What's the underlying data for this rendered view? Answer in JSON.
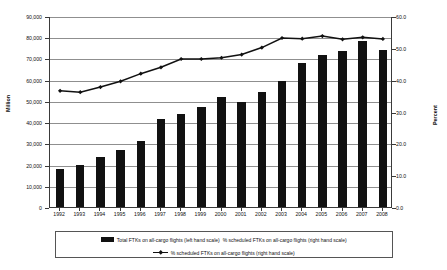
{
  "chart_data": {
    "type": "bar",
    "title": "",
    "xlabel": "",
    "ylabel": "Million",
    "y2label": "Percent",
    "ylim": [
      0,
      90000
    ],
    "y2lim": [
      0,
      60
    ],
    "yticks": [
      "0",
      "10,000",
      "20,000",
      "30,000",
      "40,000",
      "50,000",
      "60,000",
      "70,000",
      "80,000",
      "90,000"
    ],
    "ytick_values": [
      0,
      10000,
      20000,
      30000,
      40000,
      50000,
      60000,
      70000,
      80000,
      90000
    ],
    "y2ticks": [
      "0.0",
      "10.0",
      "20.0",
      "30.0",
      "40.0",
      "50.0",
      "60.0"
    ],
    "y2tick_values": [
      0,
      10,
      20,
      30,
      40,
      50,
      60
    ],
    "grid": true,
    "legend_position": "bottom",
    "categories": [
      "1992",
      "1993",
      "1994",
      "1995",
      "1996",
      "1997",
      "1998",
      "1999",
      "2000",
      "2001",
      "2002",
      "2003",
      "2004",
      "2005",
      "2006",
      "2007",
      "2008"
    ],
    "series": [
      {
        "name": "Total FTKs on all-cargo flights (left hand scale)",
        "type": "bar",
        "axis": "left",
        "color": "#111111",
        "values": [
          17800,
          19700,
          23600,
          26800,
          31300,
          41700,
          43700,
          47100,
          51700,
          49600,
          54100,
          59200,
          67800,
          71800,
          73400,
          78200,
          74200
        ]
      },
      {
        "name": "% scheduled FTKs on all-cargo flights (right hand scale)",
        "type": "line",
        "axis": "right",
        "color": "#111111",
        "marker": "diamond",
        "values": [
          36.8,
          36.4,
          38.0,
          39.8,
          42.2,
          44.2,
          46.8,
          46.8,
          47.2,
          48.2,
          50.4,
          53.4,
          53.2,
          54.0,
          53.0,
          53.6,
          53.1
        ]
      }
    ]
  },
  "legend": {
    "row1": [
      {
        "icon": "bar-swatch",
        "label": "Total FTKs on all-cargo flights (left hand scale)"
      },
      {
        "icon": "bar-swatch-implicit",
        "label": "% scheduled FTKs on all-cargo flights (right hand scale)"
      }
    ],
    "row2": [
      {
        "icon": "line-marker-swatch",
        "label": "% scheduled FTKs on all-cargo flights (right hand scale)"
      }
    ]
  }
}
